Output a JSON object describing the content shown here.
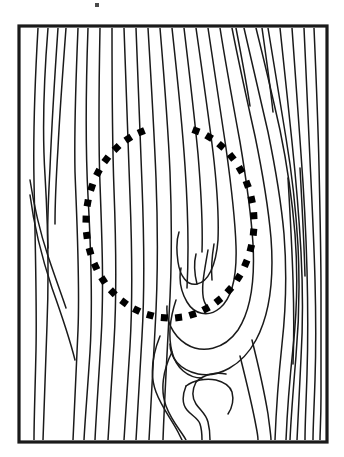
{
  "figure": {
    "title": "Wood grain surface with highlighted knot region",
    "type": "line-art-illustration",
    "width": 344,
    "height": 457,
    "background_color": "#ffffff",
    "line_color": "#1a1a1a",
    "annotation_color": "#000000"
  },
  "frame": {
    "label": "board-outline",
    "x": 19,
    "y": 26,
    "width": 308,
    "height": 416,
    "stroke_width": 3.2,
    "stroke_color": "#1a1a1a",
    "fill_color": "#ffffff"
  },
  "annotation": {
    "label": "highlighted-region",
    "shape": "dotted-open-ellipse",
    "dot_shape": "square",
    "dot_size": 7,
    "dot_color": "#000000",
    "center_x": 170,
    "center_y": 222,
    "radius_x": 84,
    "radius_y": 96,
    "start_angle_deg": -72,
    "end_angle_deg": 250,
    "dot_count": 34,
    "description": "Dotted square-marker ellipse encircling the knot area of the wood grain"
  },
  "speck": {
    "label": "scan-artifact-speck",
    "x": 95,
    "y": 3,
    "width": 4,
    "height": 4,
    "color": "#4a4a4a"
  },
  "grain": {
    "label": "wood-grain-lines",
    "line_count": 38,
    "stroke_width": 1.5,
    "note": "Near-vertical flowing grain lines that bend around a central knot, plus nested U-shaped knot loops",
    "vertical_lines": [
      "M 38 28 C 35 80 33 130 34 180 C 35 240 37 300 36 350 C 35 395 34 420 34 440",
      "M 48 28 C 44 78 42 128 45 175 C 48 225 49 275 47 325 C 45 375 44 412 43 440",
      "M 58 28 C 55 72 52 120 50 168 C 48 205 47 230 48 248",
      "M 66 28 C 63 68 60 108 58 148 C 56 180 55 205 55 224",
      "M 78 28 C 76 76 74 124 75 172 C 77 226 80 280 78 330 C 76 380 74 415 73 440",
      "M 88 28 C 86 84 85 140 88 196 C 91 250 93 302 90 352 C 87 398 85 420 84 440",
      "M 30 180 C 34 206 40 232 48 256 C 56 280 62 296 66 308",
      "M 30 195 C 34 226 42 258 52 288 C 62 316 70 340 75 360",
      "M 100 28 C 99 80 98 132 100 184 C 102 238 104 290 101 340 C 98 390 96 418 95 440",
      "M 112 28 C 112 82 112 136 114 190 C 116 242 117 292 114 342 C 111 392 109 420 108 440",
      "M 124 28 C 126 84 128 140 130 196 C 132 248 133 296 130 346 C 127 394 125 420 124 440",
      "M 136 28 C 138 80 140 132 142 184 C 144 236 145 286 142 336 C 139 388 137 418 136 440",
      "M 148 28 C 151 78 154 128 156 178 C 158 230 158 280 155 330 C 152 386 150 418 149 440",
      "M 160 28 C 164 76 168 124 170 172 C 172 222 172 268 169 316 C 166 374 164 410 163 440",
      "M 172 28 C 177 74 182 120 185 166 C 188 210 189 250 187 288",
      "M 184 28 C 189 70 194 112 198 154 C 201 190 203 222 202 252"
    ],
    "knot_loops": [
      "M 196 28 C 202 70 208 112 213 152 C 217 186 219 214 218 240 C 216 266 208 282 197 284 C 187 286 180 276 178 262 C 176 248 177 238 179 232",
      "M 208 28 C 214 68 220 108 226 148 C 231 184 235 216 236 246 C 237 276 232 298 220 308 C 208 318 194 314 187 302 C 180 290 179 278 181 268",
      "M 220 28 C 226 66 233 104 240 142 C 246 178 251 212 253 244 C 255 280 251 310 238 330 C 224 350 202 354 186 344 C 172 335 166 320 167 306",
      "M 232 28 C 239 64 247 100 255 136 C 262 170 268 204 271 238 C 274 278 270 314 256 340 C 242 366 218 378 198 374 C 180 370 170 358 170 344",
      "M 197 284 C 194 272 194 262 196 254",
      "M 208 250 C 206 262 204 272 203 282 C 202 294 203 302 207 306",
      "M 214 244 C 212 256 211 268 212 280",
      "M 176 300 C 170 318 168 336 172 352 C 176 368 188 378 202 378",
      "M 160 336 C 152 356 150 376 156 392 C 162 408 172 420 178 432 C 182 440 183 442 183 442",
      "M 172 352 C 163 370 160 390 166 406 C 172 422 182 432 186 440",
      "M 186 386 C 182 396 182 404 187 410 C 192 416 198 418 200 424 C 202 430 202 436 202 440",
      "M 196 382 C 192 390 192 398 196 404 C 200 410 206 414 208 422 C 210 430 210 436 210 440",
      "M 186 386 C 194 380 206 378 216 380 C 224 382 230 386 232 392 C 234 400 232 408 228 414",
      "M 196 382 C 204 374 216 372 226 374",
      "M 240 356 C 246 380 252 404 256 426 C 258 436 258 440 258 440",
      "M 252 340 C 258 364 264 390 268 414 C 270 430 271 436 271 440"
    ],
    "right_lines": [
      "M 244 28 C 252 62 260 96 268 132 C 275 166 281 200 284 234 C 287 272 286 308 282 344 C 278 382 276 414 275 440",
      "M 256 28 C 264 60 272 94 280 130 C 287 164 292 198 295 234 C 298 274 297 312 293 348 C 289 386 287 416 286 440",
      "M 268 28 C 274 64 280 100 286 138 C 292 174 296 210 298 246 C 300 286 299 322 296 356 C 293 392 291 418 290 440",
      "M 280 28 C 284 66 288 104 292 142 C 296 180 299 216 301 252 C 303 290 303 324 301 358 C 299 394 298 418 297 440",
      "M 292 28 C 295 70 298 112 301 154 C 304 194 306 232 307 270 C 308 308 308 342 307 374 C 306 406 305 424 305 440",
      "M 304 28 C 306 72 308 116 310 160 C 312 202 314 242 315 280 C 316 318 316 350 315 380 C 314 410 313 428 313 440",
      "M 314 28 C 316 74 318 120 319 166 C 320 210 321 252 321 292 C 321 332 321 366 321 396 C 321 420 320 432 320 440",
      "M 288 178 C 290 212 292 246 293 280 C 294 312 294 340 293 364",
      "M 300 168 C 302 204 304 240 305 276",
      "M 262 28 C 266 56 270 84 273 112",
      "M 236 28 C 241 54 246 80 250 106"
    ]
  }
}
